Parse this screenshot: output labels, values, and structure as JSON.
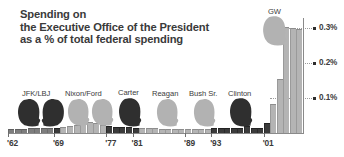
{
  "title": {
    "line1": "Spending on",
    "line2": "the Executive Office of the President",
    "line3": "as a % of total federal spending"
  },
  "chart_data": {
    "type": "bar",
    "title": "Spending on the Executive Office of the President as a % of total federal spending",
    "xlabel": "",
    "ylabel": "% of total federal spending",
    "ylim": [
      0,
      0.33
    ],
    "grid": true,
    "legend_position": "none",
    "y_ticks": [
      {
        "label": "0.1%",
        "value": 0.1
      },
      {
        "label": "0.2%",
        "value": 0.2
      },
      {
        "label": "0.3%",
        "value": 0.3
      }
    ],
    "x_ticks": [
      {
        "label": "'62",
        "year": 1962
      },
      {
        "label": "'69",
        "year": 1969
      },
      {
        "label": "'77",
        "year": 1977
      },
      {
        "label": "'81",
        "year": 1981
      },
      {
        "label": "'89",
        "year": 1989
      },
      {
        "label": "'93",
        "year": 1993
      },
      {
        "label": "'01",
        "year": 2001
      }
    ],
    "series_name": "EOP spending as % of federal spending",
    "x": [
      1962,
      1963,
      1964,
      1965,
      1966,
      1967,
      1968,
      1969,
      1970,
      1971,
      1972,
      1973,
      1974,
      1975,
      1976,
      1977,
      1978,
      1979,
      1980,
      1981,
      1982,
      1983,
      1984,
      1985,
      1986,
      1987,
      1988,
      1989,
      1990,
      1991,
      1992,
      1993,
      1994,
      1995,
      1996,
      1997,
      1998,
      1999,
      2000,
      2001,
      2002,
      2003,
      2004,
      2005,
      2006
    ],
    "values": [
      0.012,
      0.012,
      0.012,
      0.013,
      0.013,
      0.013,
      0.013,
      0.013,
      0.016,
      0.019,
      0.023,
      0.028,
      0.033,
      0.028,
      0.023,
      0.019,
      0.018,
      0.017,
      0.016,
      0.015,
      0.014,
      0.013,
      0.013,
      0.012,
      0.012,
      0.012,
      0.012,
      0.012,
      0.012,
      0.012,
      0.012,
      0.013,
      0.013,
      0.013,
      0.013,
      0.013,
      0.02,
      0.013,
      0.013,
      0.028,
      0.083,
      0.155,
      0.305,
      0.3,
      0.299
    ],
    "bar_shades": [
      "mid",
      "mid",
      "mid",
      "mid",
      "mid",
      "mid",
      "mid",
      "dark",
      "light",
      "light",
      "light",
      "light",
      "light",
      "light",
      "light",
      "dark",
      "dark",
      "dark",
      "dark",
      "dark",
      "light",
      "light",
      "light",
      "light",
      "light",
      "light",
      "light",
      "light",
      "light",
      "light",
      "light",
      "dark",
      "dark",
      "dark",
      "dark",
      "dark",
      "dark",
      "dark",
      "dark",
      "dark",
      "light",
      "light",
      "light",
      "light",
      "light"
    ],
    "annotations": [
      {
        "label": "JFK/LBJ",
        "period": "1962-1968"
      },
      {
        "label": "Nixon/Ford",
        "period": "1969-1976"
      },
      {
        "label": "Carter",
        "period": "1977-1980"
      },
      {
        "label": "Reagan",
        "period": "1981-1988"
      },
      {
        "label": "Bush Sr.",
        "period": "1989-1992"
      },
      {
        "label": "Clinton",
        "period": "1993-2000"
      },
      {
        "label": "GW",
        "period": "2001-"
      }
    ]
  },
  "presidents": [
    {
      "label": "JFK/LBJ",
      "tone": "dark"
    },
    {
      "label": "Nixon/Ford",
      "tone": "light"
    },
    {
      "label": "Carter",
      "tone": "dark"
    },
    {
      "label": "Reagan",
      "tone": "light"
    },
    {
      "label": "Bush Sr.",
      "tone": "light"
    },
    {
      "label": "Clinton",
      "tone": "dark"
    },
    {
      "label": "GW",
      "tone": "light"
    }
  ],
  "colors": {
    "bar_light": "#b4b4b4",
    "bar_mid": "#7d7d7d",
    "bar_dark": "#3b3b3b",
    "head_dark": "#2f2f2f",
    "head_light": "#b2b2b2",
    "axis": "#8a8a8a",
    "text": "#3a3a3a",
    "background": "#ffffff"
  }
}
